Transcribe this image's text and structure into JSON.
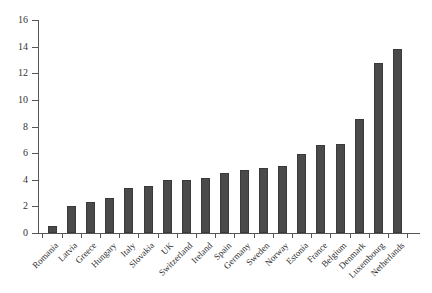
{
  "chart_data": {
    "type": "bar",
    "title": "",
    "subtitle": "",
    "xlabel": "",
    "ylabel": "",
    "ylim": [
      0,
      16
    ],
    "yticks": [
      0,
      2,
      4,
      6,
      8,
      10,
      12,
      14,
      16
    ],
    "grid": false,
    "legend": false,
    "bar_color": "#4a4a4a",
    "bar_edge_color": "#3a3a3a",
    "axis_color": "#555555",
    "categories": [
      "Romania",
      "Latvia",
      "Greece",
      "Hungary",
      "Italy",
      "Slovakia",
      "UK",
      "Switzerland",
      "Ireland",
      "Spain",
      "Germany",
      "Sweden",
      "Norway",
      "Estonia",
      "France",
      "Belgium",
      "Denmark",
      "Luxembourg",
      "Netherlands"
    ],
    "values": [
      0.5,
      2.0,
      2.3,
      2.6,
      3.4,
      3.5,
      4.0,
      4.0,
      4.1,
      4.5,
      4.7,
      4.9,
      5.0,
      5.9,
      6.6,
      6.7,
      8.6,
      12.8,
      13.8
    ]
  }
}
